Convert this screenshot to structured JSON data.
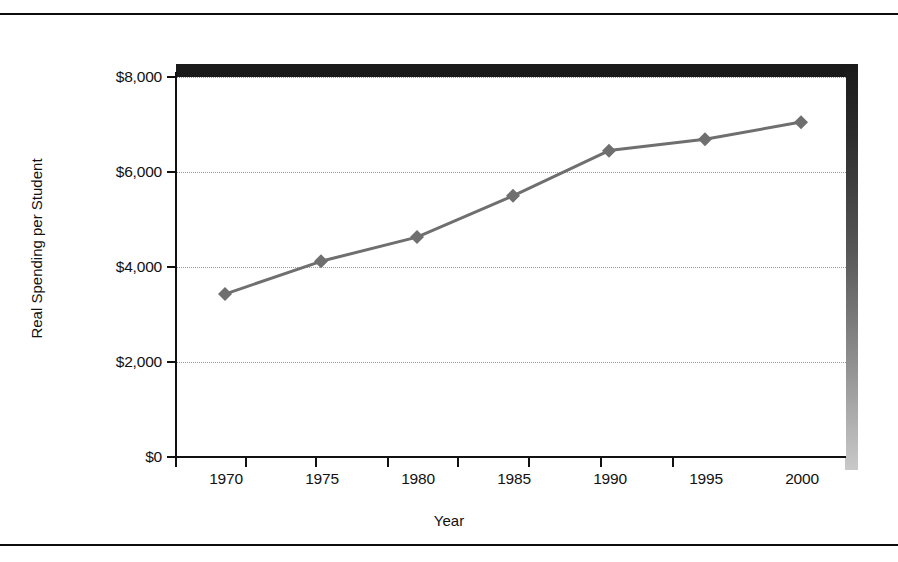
{
  "chart_data": {
    "type": "line",
    "title": "",
    "xlabel": "Year",
    "ylabel": "Real Spending per Student",
    "categories": [
      "1970",
      "1975",
      "1980",
      "1985",
      "1990",
      "1995",
      "2000"
    ],
    "x": [
      1970,
      1975,
      1980,
      1985,
      1990,
      1995,
      2000
    ],
    "values": [
      3430,
      4120,
      4630,
      5500,
      6450,
      6690,
      7050
    ],
    "series": [
      {
        "name": "Real Spending per Student",
        "values": [
          3430,
          4120,
          4630,
          5500,
          6450,
          6690,
          7050
        ]
      }
    ],
    "ylim": [
      0,
      8000
    ],
    "xlim": [
      1967.5,
      2002.5
    ],
    "ytick_labels": [
      "$0",
      "$2,000",
      "$4,000",
      "$6,000",
      "$8,000"
    ],
    "ytick_values": [
      0,
      2000,
      4000,
      6000,
      8000
    ],
    "xtick_labels": [
      "1970",
      "1975",
      "1980",
      "1985",
      "1990",
      "1995",
      "2000"
    ],
    "grid": "horizontal-dotted",
    "legend": "none",
    "marker": "diamond",
    "line_color": "#6f6f6f",
    "marker_color": "#6f6f6f",
    "axis_color": "#111111",
    "grid_color": "#9a9a9a",
    "frame_color": "#1a1a1a",
    "background": "#ffffff"
  },
  "axes": {
    "y_title": "Real Spending per Student",
    "x_title": "Year",
    "y_ticks": [
      {
        "label": "$8,000",
        "value": 8000
      },
      {
        "label": "$6,000",
        "value": 6000
      },
      {
        "label": "$4,000",
        "value": 4000
      },
      {
        "label": "$2,000",
        "value": 2000
      },
      {
        "label": "$0",
        "value": 0
      }
    ],
    "x_ticks": [
      {
        "label": "1970"
      },
      {
        "label": "1975"
      },
      {
        "label": "1980"
      },
      {
        "label": "1985"
      },
      {
        "label": "1990"
      },
      {
        "label": "1995"
      },
      {
        "label": "2000"
      }
    ]
  }
}
